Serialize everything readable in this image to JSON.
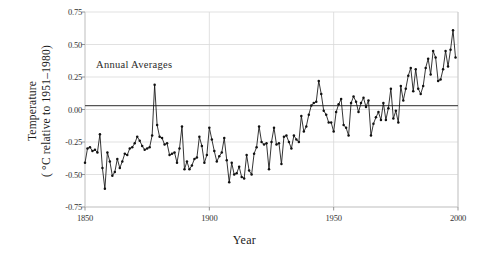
{
  "chart_data": {
    "type": "line",
    "title": "",
    "annotation": "Annual Averages",
    "xlabel": "Year",
    "ylabel_line1": "Temperature",
    "ylabel_line2": "( °C relative to 1951–1980)",
    "xlim": [
      1850,
      2000
    ],
    "ylim": [
      -0.75,
      0.75
    ],
    "xticks": [
      1850,
      1900,
      1950,
      2000
    ],
    "xtick_labels": [
      "1850",
      "1900",
      "1950",
      "2000"
    ],
    "yticks": [
      0.75,
      0.5,
      0.25,
      0,
      -0.25,
      -0.5,
      -0.75
    ],
    "ytick_labels": [
      "0.75",
      "0.50",
      "0.25",
      "0.00",
      "-0.25",
      "-0.50",
      "-0.75"
    ],
    "grid": true,
    "legend": "none",
    "reference_line": 0.03,
    "series_name": "Annual mean global surface temperature anomaly",
    "marker": "filled-circle",
    "line_color": "#111111",
    "grid_color": "#d9d9d9",
    "x": [
      1850,
      1851,
      1852,
      1853,
      1854,
      1855,
      1856,
      1857,
      1858,
      1859,
      1860,
      1861,
      1862,
      1863,
      1864,
      1865,
      1866,
      1867,
      1868,
      1869,
      1870,
      1871,
      1872,
      1873,
      1874,
      1875,
      1876,
      1877,
      1878,
      1879,
      1880,
      1881,
      1882,
      1883,
      1884,
      1885,
      1886,
      1887,
      1888,
      1889,
      1890,
      1891,
      1892,
      1893,
      1894,
      1895,
      1896,
      1897,
      1898,
      1899,
      1900,
      1901,
      1902,
      1903,
      1904,
      1905,
      1906,
      1907,
      1908,
      1909,
      1910,
      1911,
      1912,
      1913,
      1914,
      1915,
      1916,
      1917,
      1918,
      1919,
      1920,
      1921,
      1922,
      1923,
      1924,
      1925,
      1926,
      1927,
      1928,
      1929,
      1930,
      1931,
      1932,
      1933,
      1934,
      1935,
      1936,
      1937,
      1938,
      1939,
      1940,
      1941,
      1942,
      1943,
      1944,
      1945,
      1946,
      1947,
      1948,
      1949,
      1950,
      1951,
      1952,
      1953,
      1954,
      1955,
      1956,
      1957,
      1958,
      1959,
      1960,
      1961,
      1962,
      1963,
      1964,
      1965,
      1966,
      1967,
      1968,
      1969,
      1970,
      1971,
      1972,
      1973,
      1974,
      1975,
      1976,
      1977,
      1978,
      1979,
      1980,
      1981,
      1982,
      1983,
      1984,
      1985,
      1986,
      1987,
      1988,
      1989,
      1990,
      1991,
      1992,
      1993,
      1994,
      1995,
      1996,
      1997,
      1998,
      1999
    ],
    "y": [
      -0.41,
      -0.3,
      -0.29,
      -0.32,
      -0.31,
      -0.33,
      -0.19,
      -0.45,
      -0.61,
      -0.33,
      -0.4,
      -0.51,
      -0.48,
      -0.38,
      -0.45,
      -0.4,
      -0.34,
      -0.35,
      -0.3,
      -0.29,
      -0.26,
      -0.21,
      -0.24,
      -0.28,
      -0.31,
      -0.3,
      -0.29,
      -0.2,
      0.19,
      -0.12,
      -0.21,
      -0.22,
      -0.27,
      -0.26,
      -0.35,
      -0.34,
      -0.33,
      -0.41,
      -0.3,
      -0.13,
      -0.46,
      -0.4,
      -0.46,
      -0.43,
      -0.38,
      -0.37,
      -0.21,
      -0.28,
      -0.41,
      -0.35,
      -0.14,
      -0.23,
      -0.32,
      -0.4,
      -0.36,
      -0.33,
      -0.22,
      -0.39,
      -0.56,
      -0.41,
      -0.5,
      -0.49,
      -0.44,
      -0.52,
      -0.53,
      -0.35,
      -0.47,
      -0.5,
      -0.34,
      -0.29,
      -0.13,
      -0.25,
      -0.27,
      -0.26,
      -0.46,
      -0.25,
      -0.14,
      -0.27,
      -0.26,
      -0.42,
      -0.21,
      -0.2,
      -0.25,
      -0.3,
      -0.2,
      -0.23,
      -0.25,
      -0.05,
      -0.17,
      -0.13,
      -0.04,
      0.03,
      0.05,
      0.06,
      0.22,
      0.12,
      -0.01,
      -0.04,
      -0.1,
      -0.1,
      -0.17,
      -0.02,
      0.04,
      0.08,
      -0.12,
      -0.14,
      -0.2,
      0.05,
      0.1,
      0.06,
      -0.02,
      0.05,
      0.09,
      0.02,
      0.07,
      -0.2,
      -0.11,
      -0.06,
      -0.02,
      -0.08,
      0.05,
      -0.08,
      0.01,
      0.16,
      -0.07,
      -0.01,
      -0.1,
      0.18,
      0.07,
      0.16,
      0.26,
      0.32,
      0.14,
      0.31,
      0.16,
      0.12,
      0.18,
      0.32,
      0.39,
      0.27,
      0.45,
      0.4,
      0.22,
      0.23,
      0.31,
      0.45,
      0.33,
      0.46,
      0.61,
      0.4
    ]
  },
  "axes": {
    "plot_left_px": 85,
    "plot_right_px": 458,
    "plot_top_px": 12,
    "plot_bottom_px": 207
  }
}
